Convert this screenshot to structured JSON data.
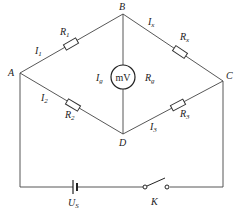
{
  "diagram": {
    "nodes": {
      "A": "A",
      "B": "B",
      "C": "C",
      "D": "D"
    },
    "resistors": {
      "r1": {
        "name": "R",
        "sub": "1"
      },
      "r2": {
        "name": "R",
        "sub": "2"
      },
      "r3": {
        "name": "R",
        "sub": "3"
      },
      "rx": {
        "name": "R",
        "sub": "x"
      },
      "rg": {
        "name": "R",
        "sub": "g"
      }
    },
    "currents": {
      "i1": {
        "name": "I",
        "sub": "1"
      },
      "i2": {
        "name": "I",
        "sub": "2"
      },
      "i3": {
        "name": "I",
        "sub": "3"
      },
      "ix": {
        "name": "I",
        "sub": "x"
      },
      "ig": {
        "name": "I",
        "sub": "g"
      }
    },
    "meter": {
      "label": "mV"
    },
    "source": {
      "name": "U",
      "sub": "S"
    },
    "switch": {
      "label": "K"
    }
  }
}
